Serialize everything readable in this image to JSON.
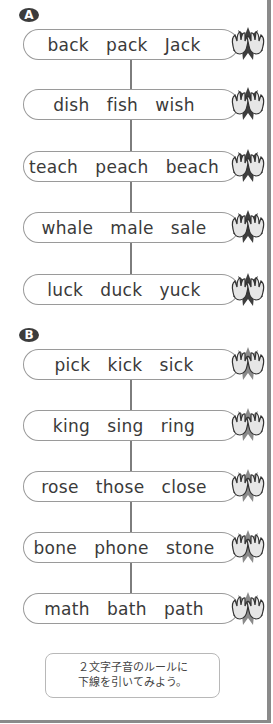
{
  "sections": [
    {
      "label": "A",
      "rows": [
        {
          "words": "back   pack   Jack",
          "top": 29
        },
        {
          "words": "dish   fish   wish",
          "top": 89
        },
        {
          "words": "teach   peach   beach",
          "top": 151
        },
        {
          "words": "whale   male   sale",
          "top": 212
        },
        {
          "words": "luck   duck   yuck",
          "top": 274
        }
      ]
    },
    {
      "label": "B",
      "rows": [
        {
          "words": "pick   kick   sick",
          "top": 349
        },
        {
          "words": "king   sing   ring",
          "top": 410
        },
        {
          "words": "rose   those   close",
          "top": 471
        },
        {
          "words": "bone   phone   stone",
          "top": 532
        },
        {
          "words": "math   bath   path",
          "top": 593
        }
      ]
    }
  ],
  "icons": {
    "clap": "clapping-hands-icon"
  },
  "colors": {
    "clap_burst_A": "#3e3e3e",
    "clap_burst_B": "#8a8a8a",
    "border": "#8a8a8a"
  },
  "note": {
    "line1": "２文字子音のルールに",
    "line2": "下線を引いてみよう。"
  }
}
